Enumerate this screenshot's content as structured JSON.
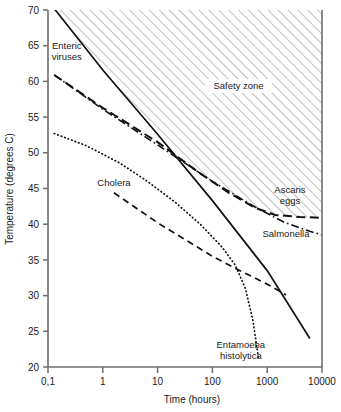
{
  "chart_data": {
    "type": "line",
    "title": "",
    "xlabel": "Time (hours)",
    "ylabel": "Temperature (degrees C)",
    "xscale": "log",
    "yscale": "linear",
    "xlim": [
      0.1,
      10000
    ],
    "ylim": [
      20,
      70
    ],
    "grid": false,
    "legend_position": "inline-annotations",
    "xticks": [
      "0,1",
      "1",
      "10",
      "100",
      "1000",
      "10000"
    ],
    "xtick_values": [
      0.1,
      1,
      10,
      100,
      1000,
      10000
    ],
    "yticks": [
      "20",
      "25",
      "30",
      "35",
      "40",
      "45",
      "50",
      "55",
      "60",
      "65",
      "70"
    ],
    "ytick_values": [
      20,
      25,
      30,
      35,
      40,
      45,
      50,
      55,
      60,
      65,
      70
    ],
    "annotations": [
      {
        "text": "Safety zone",
        "x": 300,
        "y": 59
      },
      {
        "text": "Enteric viruses",
        "x": 0.22,
        "y": 64.5
      },
      {
        "text": "Cholera",
        "x": 1.6,
        "y": 45.3
      },
      {
        "text": "Ascaris eggs",
        "x": 2600,
        "y": 44.3
      },
      {
        "text": "Salmonella",
        "x": 2200,
        "y": 38.2
      },
      {
        "text": "Entamoeba histolytica",
        "x": 330,
        "y": 22.6
      }
    ],
    "series": [
      {
        "name": "Enteric viruses",
        "style": "solid",
        "points": [
          [
            0.13,
            70.2
          ],
          [
            1,
            61.6
          ],
          [
            10,
            52.6
          ],
          [
            100,
            43.3
          ],
          [
            1000,
            33.5
          ],
          [
            6000,
            24.0
          ]
        ]
      },
      {
        "name": "Ascaris eggs",
        "style": "long-dash",
        "points": [
          [
            0.13,
            60.9
          ],
          [
            1,
            56.3
          ],
          [
            10,
            51.5
          ],
          [
            60,
            47.1
          ],
          [
            200,
            44.4
          ],
          [
            600,
            42.3
          ],
          [
            1400,
            41.3
          ],
          [
            4000,
            41.0
          ],
          [
            10000,
            40.9
          ]
        ]
      },
      {
        "name": "Salmonella",
        "style": "dash-dot",
        "points": [
          [
            0.13,
            60.9
          ],
          [
            1,
            56.1
          ],
          [
            10,
            51.1
          ],
          [
            100,
            46.0
          ],
          [
            600,
            42.4
          ],
          [
            2000,
            40.3
          ],
          [
            6000,
            39.0
          ],
          [
            10000,
            38.5
          ]
        ]
      },
      {
        "name": "Entamoeba histolytica",
        "style": "dotted",
        "points": [
          [
            0.13,
            52.7
          ],
          [
            0.5,
            51.0
          ],
          [
            2,
            48.6
          ],
          [
            6,
            46.2
          ],
          [
            20,
            43.2
          ],
          [
            60,
            40.0
          ],
          [
            150,
            36.8
          ],
          [
            260,
            34.3
          ],
          [
            400,
            31.0
          ],
          [
            550,
            26.5
          ],
          [
            700,
            21.0
          ]
        ]
      },
      {
        "name": "Cholera",
        "style": "dash",
        "points": [
          [
            1.6,
            44.4
          ],
          [
            10,
            40.2
          ],
          [
            100,
            35.5
          ],
          [
            300,
            33.6
          ],
          [
            1000,
            31.6
          ],
          [
            2200,
            30.1
          ]
        ]
      }
    ],
    "safety_zone": {
      "label": "Safety zone",
      "fill": "hatched",
      "hatch_color": "#8a8a8a",
      "description": "Region above the Enteric viruses curve and above the Ascaris eggs curve"
    },
    "colors": {
      "axis": "#6e6e6e",
      "line": "#111111",
      "text": "#1a1a1a",
      "hatch": "#8f8f8f",
      "background": "#ffffff"
    }
  }
}
